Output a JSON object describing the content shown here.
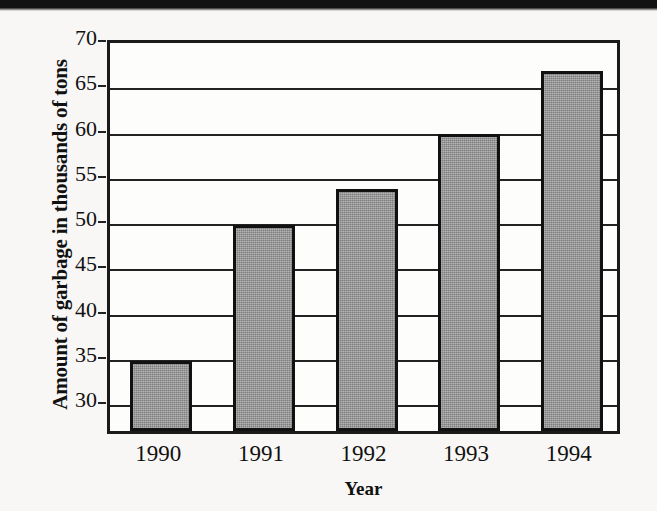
{
  "chart_data": {
    "type": "bar",
    "title": "",
    "categories": [
      "1990",
      "1991",
      "1992",
      "1993",
      "1994"
    ],
    "values": [
      34.2,
      49.2,
      53.2,
      59.3,
      66.3
    ],
    "xlabel": "Year",
    "ylabel": "Amount of garbage in thousands of tons",
    "ylim": [
      26.5,
      70
    ],
    "yticks": [
      30,
      35,
      40,
      45,
      50,
      55,
      60,
      65,
      70
    ],
    "ytick_labels": [
      "30",
      "35",
      "40",
      "45",
      "50",
      "55",
      "60",
      "65",
      "70"
    ],
    "grid": true,
    "legend": false,
    "bar_color": "#9b9b9b",
    "bar_edge_color": "#111111",
    "axis_color": "#1a1a1a",
    "background_color": "#f8f7f5"
  }
}
